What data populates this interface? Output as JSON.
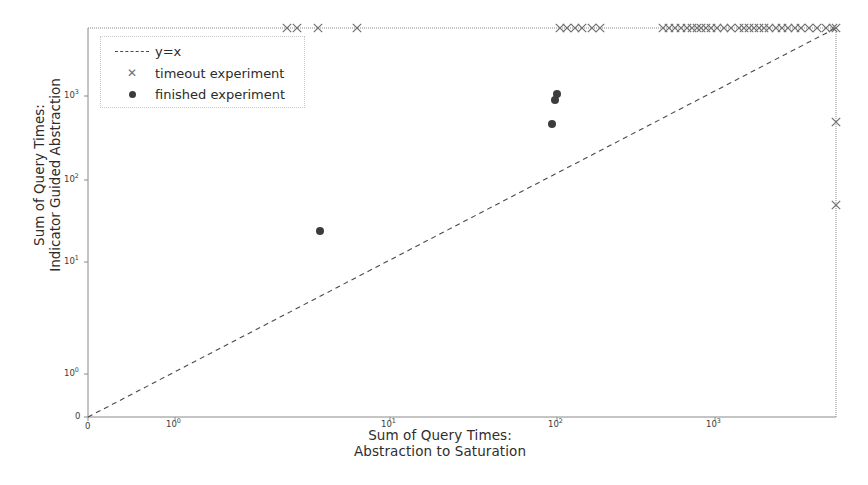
{
  "chart_data": {
    "type": "scatter",
    "title": "",
    "xlabel": "Sum of Query Times:\nAbstraction to Saturation",
    "xlabel_line1": "Sum of Query Times:",
    "xlabel_line2": "Abstraction to Saturation",
    "ylabel_line1": "Sum of Query Times:",
    "ylabel_line2": "Indicator Guided Abstraction",
    "xscale": "log",
    "yscale": "log",
    "grid": false,
    "legend_position": "upper left",
    "x_tick_labels": [
      "0",
      "10⁰",
      "10¹",
      "10²",
      "10³"
    ],
    "y_tick_labels": [
      "0",
      "10⁰",
      "10¹",
      "10²",
      "10³"
    ],
    "x_ticks_px": [
      88,
      175,
      390,
      557,
      715
    ],
    "y_ticks_px": [
      417,
      374,
      262,
      180,
      96
    ],
    "xlim": [
      0,
      4000
    ],
    "ylim": [
      0,
      4000
    ],
    "reference_line": {
      "name": "y=x",
      "label": "y=x",
      "style": "dashed",
      "color": "#4a4a4a"
    },
    "series": [
      {
        "name": "timeout experiment",
        "label": "timeout experiment",
        "marker": "x",
        "color": "#6f6f6f",
        "note": "timeouts drawn at the plot ceiling (top spine) and right spine",
        "points_px": [
          [
            287,
            28
          ],
          [
            297,
            28
          ],
          [
            318,
            28
          ],
          [
            357,
            28
          ],
          [
            560,
            28
          ],
          [
            567,
            28
          ],
          [
            575,
            28
          ],
          [
            582,
            28
          ],
          [
            592,
            28
          ],
          [
            600,
            28
          ],
          [
            663,
            28
          ],
          [
            669,
            28
          ],
          [
            675,
            28
          ],
          [
            681,
            28
          ],
          [
            687,
            28
          ],
          [
            692,
            28
          ],
          [
            697,
            28
          ],
          [
            701,
            28
          ],
          [
            706,
            28
          ],
          [
            711,
            28
          ],
          [
            717,
            28
          ],
          [
            724,
            28
          ],
          [
            731,
            28
          ],
          [
            739,
            28
          ],
          [
            744,
            28
          ],
          [
            749,
            28
          ],
          [
            754,
            28
          ],
          [
            759,
            28
          ],
          [
            764,
            28
          ],
          [
            769,
            28
          ],
          [
            776,
            28
          ],
          [
            782,
            28
          ],
          [
            788,
            28
          ],
          [
            795,
            28
          ],
          [
            801,
            28
          ],
          [
            809,
            28
          ],
          [
            817,
            28
          ],
          [
            826,
            28
          ],
          [
            833,
            28
          ],
          [
            836,
            28
          ],
          [
            836,
            122
          ],
          [
            836,
            205
          ]
        ]
      },
      {
        "name": "finished experiment",
        "label": "finished experiment",
        "marker": "o",
        "color": "#3c3c3c",
        "points_px": [
          [
            320,
            231
          ],
          [
            557,
            94
          ],
          [
            555,
            100
          ],
          [
            552,
            124
          ]
        ]
      }
    ]
  },
  "legend": {
    "items": [
      {
        "label": "y=x",
        "key": "dashed-line-key"
      },
      {
        "label": "timeout experiment",
        "key": "cross-marker-key"
      },
      {
        "label": "finished experiment",
        "key": "dot-marker-key"
      }
    ]
  },
  "axes": {
    "x_label_line1": "Sum of Query Times:",
    "x_label_line2": "Abstraction to Saturation",
    "y_label_line1": "Sum of Query Times:",
    "y_label_line2": "Indicator Guided Abstraction",
    "x_tick_zero": "0",
    "y_tick_zero": "0",
    "x_ticks": [
      {
        "mantissa": "10",
        "exp": "0",
        "px": 175
      },
      {
        "mantissa": "10",
        "exp": "1",
        "px": 390
      },
      {
        "mantissa": "10",
        "exp": "2",
        "px": 557
      },
      {
        "mantissa": "10",
        "exp": "3",
        "px": 715
      }
    ],
    "y_ticks": [
      {
        "mantissa": "10",
        "exp": "0",
        "px": 374
      },
      {
        "mantissa": "10",
        "exp": "1",
        "px": 262
      },
      {
        "mantissa": "10",
        "exp": "2",
        "px": 180
      },
      {
        "mantissa": "10",
        "exp": "3",
        "px": 96
      }
    ]
  },
  "colors": {
    "spine": "#8a8a8a",
    "marker_timeout": "#6f6f6f",
    "marker_finished": "#3c3c3c",
    "reference_line": "#4a4a4a",
    "text": "#2b2b2b",
    "background": "#ffffff"
  }
}
